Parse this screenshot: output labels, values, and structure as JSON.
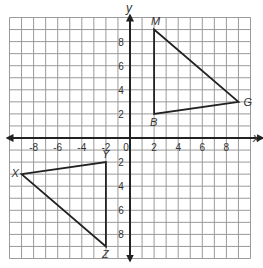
{
  "diagram": {
    "type": "coordinate-plane",
    "axes": {
      "x_label": "x",
      "y_label": "y",
      "range": {
        "xmin": -10,
        "xmax": 10,
        "ymin": -10,
        "ymax": 10
      },
      "grid_step": 1,
      "x_ticks": [
        {
          "value": -8,
          "label": "-8"
        },
        {
          "value": -6,
          "label": "-6"
        },
        {
          "value": -4,
          "label": "-4"
        },
        {
          "value": -2,
          "label": "-2"
        },
        {
          "value": 0,
          "label": "0"
        },
        {
          "value": 2,
          "label": "2"
        },
        {
          "value": 4,
          "label": "4"
        },
        {
          "value": 6,
          "label": "6"
        },
        {
          "value": 8,
          "label": "8"
        }
      ],
      "y_ticks": [
        {
          "value": 8,
          "label": "8"
        },
        {
          "value": 6,
          "label": "6"
        },
        {
          "value": 4,
          "label": "4"
        },
        {
          "value": 2,
          "label": "2"
        },
        {
          "value": -2,
          "label": "2"
        },
        {
          "value": -4,
          "label": "4"
        },
        {
          "value": -6,
          "label": "6"
        },
        {
          "value": -8,
          "label": "8"
        }
      ]
    },
    "triangles": [
      {
        "name": "MBG",
        "vertices": [
          {
            "label": "M",
            "x": 2,
            "y": 9
          },
          {
            "label": "B",
            "x": 2,
            "y": 2
          },
          {
            "label": "G",
            "x": 9,
            "y": 3
          }
        ]
      },
      {
        "name": "XYZ",
        "vertices": [
          {
            "label": "X",
            "x": -9,
            "y": -3
          },
          {
            "label": "Y",
            "x": -2,
            "y": -2
          },
          {
            "label": "Z",
            "x": -2,
            "y": -9
          }
        ]
      }
    ],
    "colors": {
      "grid": "#9a9a9a",
      "axis": "#222222",
      "shape": "#222222",
      "text": "#333333"
    }
  }
}
